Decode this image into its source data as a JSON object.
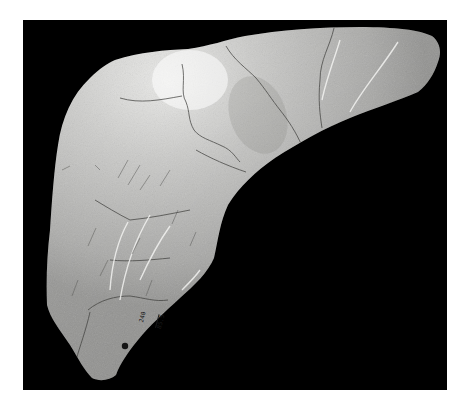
{
  "image": {
    "subject": "bone fragment specimen photographed on black background",
    "background_color": "#000000",
    "border_color": "#ffffff",
    "bone_base_color": "#c9c9c7",
    "bone_highlight_color": "#f2f2f0",
    "bone_shadow_color": "#8e8e8c",
    "crack_color": "#4a4a48"
  },
  "specimen_label": {
    "numerator": "240",
    "denominator": "85.5",
    "marker": "black dot"
  }
}
